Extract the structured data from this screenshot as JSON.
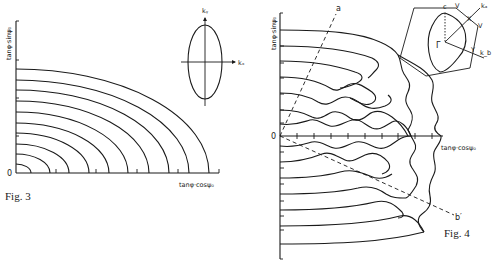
{
  "figures": [
    {
      "id": "fig3",
      "caption": "Fig. 3",
      "x_axis_label": "tanφ·cosψ₀",
      "y_axis_label": "tanφ·sinψ₀",
      "origin_label": "0",
      "inset": {
        "kx_label": "kₓ",
        "ky_label": "kᵧ",
        "shape": "ellipse"
      },
      "curve_count": 10
    },
    {
      "id": "fig4",
      "caption": "Fig. 4",
      "x_axis_label": "tanφ·cosψ₀",
      "y_axis_label": "tanφ·sinψ₀",
      "origin_label": "0",
      "dashed_line_labels": {
        "upper": "a",
        "lower": "b′"
      },
      "inset": {
        "labels": {
          "c": "c",
          "gamma": "Γ",
          "ka": "kₐ",
          "kb": "k_b",
          "v1": "V",
          "v2": "V",
          "x": "X",
          "y": "Y"
        },
        "shape": "hexagon"
      },
      "curve_count": 13
    }
  ]
}
